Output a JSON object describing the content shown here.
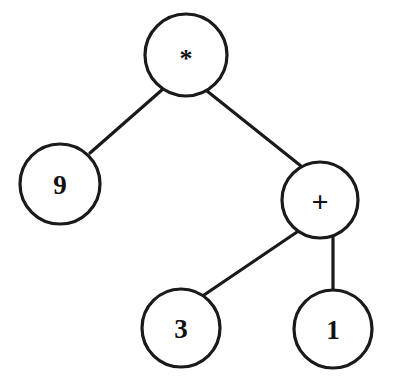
{
  "diagram": {
    "background_color": "#ffffff",
    "stroke_color": "#1a1a1a",
    "text_color": "#111111",
    "expression": "9 * (3 + 1)",
    "nodes": [
      {
        "id": "root",
        "label": "*",
        "kind": "operator",
        "cx": 186,
        "cy": 55,
        "r": 41
      },
      {
        "id": "left",
        "label": "9",
        "kind": "operand",
        "cx": 60,
        "cy": 184,
        "r": 40
      },
      {
        "id": "right",
        "label": "+",
        "kind": "operator",
        "cx": 320,
        "cy": 200,
        "r": 38
      },
      {
        "id": "rleft",
        "label": "3",
        "kind": "operand",
        "cx": 181,
        "cy": 328,
        "r": 39
      },
      {
        "id": "rright",
        "label": "1",
        "kind": "operand",
        "cx": 333,
        "cy": 329,
        "r": 39
      }
    ],
    "edges": [
      {
        "id": "root-left",
        "from": "root",
        "to": "left",
        "x1": 163,
        "y1": 89,
        "x2": 90,
        "y2": 153
      },
      {
        "id": "root-right",
        "from": "root",
        "to": "right",
        "x1": 207,
        "y1": 91,
        "x2": 301,
        "y2": 166
      },
      {
        "id": "right-left",
        "from": "right",
        "to": "rleft",
        "x1": 297,
        "y1": 232,
        "x2": 204,
        "y2": 295
      },
      {
        "id": "right-right",
        "from": "right",
        "to": "rright",
        "x1": 333,
        "y1": 238,
        "x2": 333,
        "y2": 290
      }
    ]
  }
}
